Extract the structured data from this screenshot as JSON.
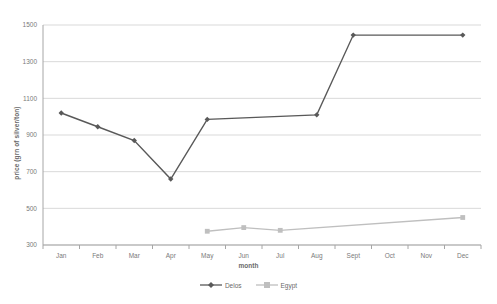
{
  "chart_data": {
    "type": "line",
    "title": "",
    "xlabel": "month",
    "ylabel": "price (grn of silver/ton)",
    "categories": [
      "Jan",
      "Feb",
      "Mar",
      "Apr",
      "May",
      "Jun",
      "Jul",
      "Aug",
      "Sept",
      "Oct",
      "Nov",
      "Dec"
    ],
    "ylim": [
      300,
      1500
    ],
    "yticks": [
      300,
      500,
      700,
      900,
      1100,
      1300,
      1500
    ],
    "grid": true,
    "legend_position": "bottom",
    "series": [
      {
        "name": "Delos",
        "color": "#595959",
        "marker": "diamond",
        "values": [
          1020,
          945,
          870,
          660,
          985,
          null,
          null,
          1010,
          1445,
          null,
          null,
          1445
        ]
      },
      {
        "name": "Egypt",
        "color": "#bfbfbf",
        "marker": "square",
        "values": [
          null,
          null,
          null,
          null,
          375,
          395,
          380,
          null,
          null,
          null,
          null,
          450
        ]
      }
    ]
  },
  "legend": {
    "items": [
      {
        "label": "Delos"
      },
      {
        "label": "Egypt"
      }
    ]
  },
  "axis": {
    "y_title": "price (grn of silver/ton)",
    "x_title": "month",
    "y_tick_labels": [
      "1500",
      "1300",
      "1100",
      "900",
      "700",
      "500",
      "300"
    ],
    "x_tick_labels": [
      "Jan",
      "Feb",
      "Mar",
      "Apr",
      "May",
      "Jun",
      "Jul",
      "Aug",
      "Sept",
      "Oct",
      "Nov",
      "Dec"
    ]
  },
  "colors": {
    "delos": "#595959",
    "egypt": "#bfbfbf",
    "grid": "#d9d9d9",
    "axis": "#a6a6a6",
    "text": "#6a6a6a"
  }
}
